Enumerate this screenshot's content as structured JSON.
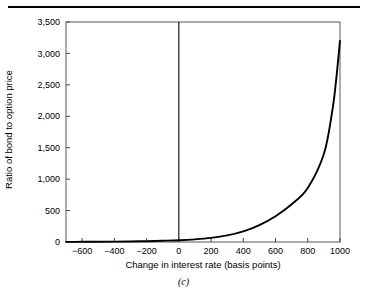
{
  "figure": {
    "panel_label": "(c)",
    "has_top_rule": true,
    "background_color": "#ffffff",
    "line_color": "#000000",
    "frame_color": "#555555"
  },
  "chart_data": {
    "type": "line",
    "title": "",
    "subtitle": "",
    "xlabel": "Change in interest rate (basis points)",
    "ylabel": "Ratio of bond to option price",
    "xlim": [
      -700,
      1000
    ],
    "ylim": [
      0,
      3500
    ],
    "grid": false,
    "legend": null,
    "xticks": [
      -600,
      -400,
      -200,
      0,
      200,
      400,
      600,
      800,
      1000
    ],
    "xtick_labels": [
      "−600",
      "−400",
      "−200",
      "0",
      "200",
      "400",
      "600",
      "800",
      "1000"
    ],
    "yticks": [
      0,
      500,
      1000,
      1500,
      2000,
      2500,
      3000,
      3500
    ],
    "ytick_labels": [
      "0",
      "500",
      "1,000",
      "1,500",
      "2,000",
      "2,500",
      "3,000",
      "3,500"
    ],
    "annotations": [
      {
        "name": "zero-reference-line",
        "type": "vline",
        "x": 0
      }
    ],
    "series": [
      {
        "name": "Ratio of bond to option price",
        "x": [
          -700,
          -600,
          -500,
          -400,
          -300,
          -200,
          -100,
          0,
          100,
          200,
          300,
          400,
          500,
          600,
          700,
          800,
          900,
          950,
          975,
          1000
        ],
        "values": [
          2,
          3,
          4,
          6,
          9,
          13,
          20,
          28,
          42,
          65,
          105,
          170,
          270,
          410,
          600,
          860,
          1400,
          2050,
          2550,
          3200
        ]
      }
    ]
  }
}
